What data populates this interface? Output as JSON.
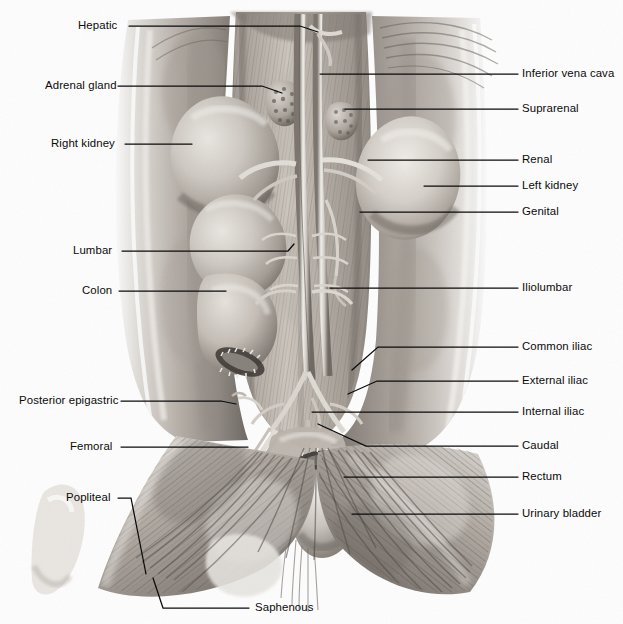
{
  "figure": {
    "style": "grayscale pencil / airbrush medical illustration",
    "background_color": "#fdfdfd",
    "leader_line_color": "#0b0b0b",
    "text_color": "#0a0a0a",
    "width": 623,
    "height": 624
  },
  "labels_left": [
    {
      "id": "hepatic",
      "text": "Hepatic",
      "text_x": 78,
      "text_y": 30,
      "line": "M129,26 L300,26 L318,32"
    },
    {
      "id": "adrenal-gland",
      "text": "Adrenal gland",
      "text_x": 45,
      "text_y": 90,
      "line": "M118,86 L262,86 L282,93"
    },
    {
      "id": "right-kidney",
      "text": "Right kidney",
      "text_x": 51,
      "text_y": 148,
      "line": "M125,144 L192,144"
    },
    {
      "id": "lumbar",
      "text": "Lumbar",
      "text_x": 73,
      "text_y": 255,
      "line": "M122,251 L288,251 L294,244"
    },
    {
      "id": "colon",
      "text": "Colon",
      "text_x": 82,
      "text_y": 295,
      "line": "M119,291 L226,291"
    },
    {
      "id": "posterior-epigastric",
      "text": "Posterior epigastric",
      "text_x": 19,
      "text_y": 405,
      "line": "M121,401 L221,401 L236,404"
    },
    {
      "id": "femoral",
      "text": "Femoral",
      "text_x": 70,
      "text_y": 451,
      "line": "M121,447 L248,447"
    },
    {
      "id": "popliteal",
      "text": "Popliteal",
      "text_x": 66,
      "text_y": 502,
      "line": "M118,498 L131,498 L146,574"
    },
    {
      "id": "saphenous",
      "text": "Saphenous",
      "text_x": 255,
      "text_y": 612,
      "line": "M249,608 L163,608 L153,578"
    }
  ],
  "labels_right": [
    {
      "id": "inferior-vena-cava",
      "text": "Inferior vena cava",
      "text_x": 522,
      "text_y": 78,
      "line": "M518,74 L320,74"
    },
    {
      "id": "suprarenal",
      "text": "Suprarenal",
      "text_x": 522,
      "text_y": 113,
      "line": "M518,109 L345,109"
    },
    {
      "id": "renal",
      "text": "Renal",
      "text_x": 522,
      "text_y": 164,
      "line": "M518,160 L368,160"
    },
    {
      "id": "left-kidney",
      "text": "Left kidney",
      "text_x": 522,
      "text_y": 190,
      "line": "M518,186 L424,186"
    },
    {
      "id": "genital",
      "text": "Genital",
      "text_x": 522,
      "text_y": 216,
      "line": "M518,212 L360,212"
    },
    {
      "id": "iliolumbar",
      "text": "Iliolumbar",
      "text_x": 522,
      "text_y": 292,
      "line": "M518,288 L330,288"
    },
    {
      "id": "common-iliac",
      "text": "Common iliac",
      "text_x": 522,
      "text_y": 351,
      "line": "M518,347 L378,347 L352,370"
    },
    {
      "id": "external-iliac",
      "text": "External iliac",
      "text_x": 522,
      "text_y": 385,
      "line": "M518,381 L377,381 L348,394"
    },
    {
      "id": "internal-iliac",
      "text": "Internal iliac",
      "text_x": 522,
      "text_y": 416,
      "line": "M518,412 L312,412"
    },
    {
      "id": "caudal",
      "text": "Caudal",
      "text_x": 522,
      "text_y": 450,
      "line": "M518,446 L366,446 L318,424"
    },
    {
      "id": "rectum",
      "text": "Rectum",
      "text_x": 522,
      "text_y": 481,
      "line": "M518,477 L344,477"
    },
    {
      "id": "urinary-bladder",
      "text": "Urinary bladder",
      "text_x": 522,
      "text_y": 518,
      "line": "M518,514 L352,514"
    }
  ],
  "structures": [
    {
      "id": "right-kidney-organ",
      "name": "Right kidney"
    },
    {
      "id": "left-kidney-organ",
      "name": "Left kidney"
    },
    {
      "id": "adrenal-gland-organ",
      "name": "Adrenal gland"
    },
    {
      "id": "suprarenal-gland-organ",
      "name": "Suprarenal gland"
    },
    {
      "id": "colon-organ",
      "name": "Colon"
    },
    {
      "id": "urinary-bladder-organ",
      "name": "Urinary bladder"
    },
    {
      "id": "aorta-vessel",
      "name": "Aorta"
    },
    {
      "id": "inferior-vena-cava-vessel",
      "name": "Inferior vena cava"
    },
    {
      "id": "left-thigh-muscle",
      "name": "Left thigh musculature"
    },
    {
      "id": "right-thigh-muscle",
      "name": "Right thigh musculature"
    },
    {
      "id": "abdominal-wall-flap",
      "name": "Reflected abdominal wall"
    }
  ]
}
